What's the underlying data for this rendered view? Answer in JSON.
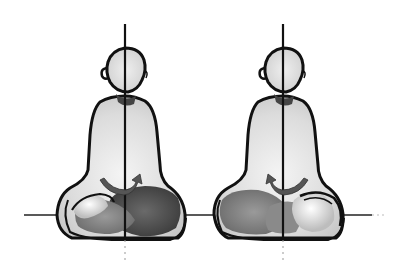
{
  "image": {
    "description": "Two hand-drawn sketches of seated meditating figures with a vertical spine axis and a horizontal ground line; curved arrows at the pelvis indicate rotation direction",
    "background": "#ffffff",
    "ink_color": "#111111",
    "shade_dark": "#555555",
    "shade_light": "#d9d9d9",
    "figures": [
      {
        "id": "left",
        "center_x": 125,
        "arrow_direction": "clockwise-right",
        "heavy_side": "right"
      },
      {
        "id": "right",
        "center_x": 283,
        "arrow_direction": "counterclockwise-left",
        "heavy_side": "left"
      }
    ],
    "ground_line_y": 215
  }
}
